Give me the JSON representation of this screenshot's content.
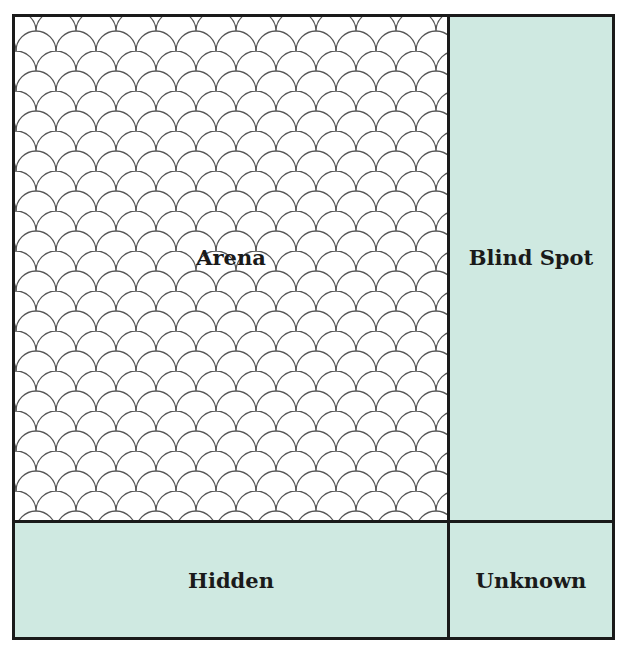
{
  "diagram": {
    "type": "johari-window",
    "colors": {
      "border": "#1a1a1a",
      "tint": "#cfe9e1",
      "arena_bg": "#ffffff",
      "pattern_stroke": "#555555"
    },
    "quadrants": {
      "arena": {
        "label": "Arena",
        "fill": "scallop-pattern"
      },
      "blind_spot": {
        "label": "Blind Spot",
        "fill": "tint"
      },
      "hidden": {
        "label": "Hidden",
        "fill": "tint"
      },
      "unknown": {
        "label": "Unknown",
        "fill": "tint"
      }
    }
  }
}
